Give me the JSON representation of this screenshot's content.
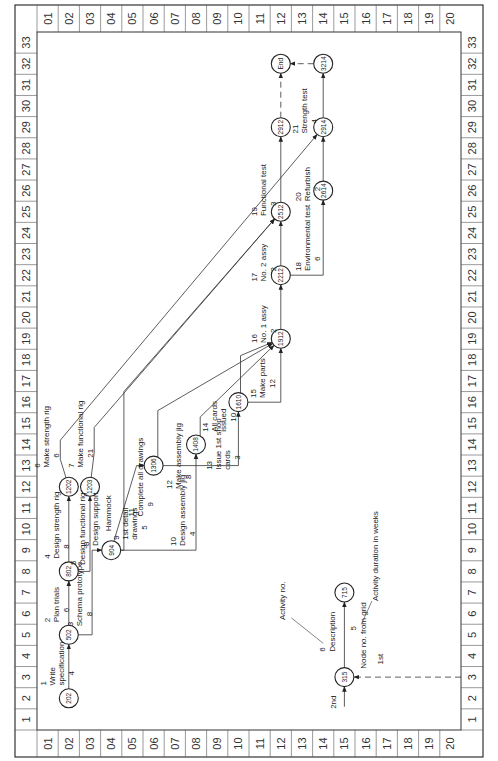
{
  "grid": {
    "columns": [
      "1",
      "2",
      "3",
      "4",
      "5",
      "6",
      "7",
      "8",
      "9",
      "10",
      "11",
      "12",
      "13",
      "14",
      "15",
      "16",
      "17",
      "18",
      "19",
      "20",
      "21",
      "22",
      "23",
      "24",
      "25",
      "26",
      "27",
      "28",
      "29",
      "30",
      "31",
      "32",
      "33"
    ],
    "rows": [
      "01",
      "02",
      "03",
      "04",
      "05",
      "06",
      "07",
      "08",
      "09",
      "10",
      "11",
      "12",
      "13",
      "14",
      "15",
      "16",
      "17",
      "18",
      "19",
      "20"
    ]
  },
  "nodes": [
    {
      "id": "202",
      "col": 2,
      "row": 2
    },
    {
      "id": "502",
      "col": 5,
      "row": 2
    },
    {
      "id": "802",
      "col": 8,
      "row": 2
    },
    {
      "id": "1202",
      "col": 12,
      "row": 2
    },
    {
      "id": "1203",
      "col": 12,
      "row": 3
    },
    {
      "id": "904",
      "col": 9,
      "row": 4
    },
    {
      "id": "1306",
      "col": 13,
      "row": 6
    },
    {
      "id": "1408",
      "col": 14,
      "row": 8
    },
    {
      "id": "1610",
      "col": 16,
      "row": 10
    },
    {
      "id": "1912",
      "col": 19,
      "row": 12
    },
    {
      "id": "2212",
      "col": 22,
      "row": 12
    },
    {
      "id": "2512",
      "col": 25,
      "row": 12
    },
    {
      "id": "2912",
      "col": 29,
      "row": 12
    },
    {
      "id": "END",
      "col": 32,
      "row": 12
    },
    {
      "id": "2614",
      "col": 26,
      "row": 14
    },
    {
      "id": "2914",
      "col": 29,
      "row": 14
    },
    {
      "id": "3214",
      "col": 32,
      "row": 14
    }
  ],
  "activities": [
    {
      "no": "1",
      "desc": "Write specification",
      "desc_lines": [
        "Write",
        "specification"
      ],
      "duration": "4",
      "from": "202",
      "to": "502"
    },
    {
      "no": "2",
      "desc": "Plan trials",
      "desc_lines": [
        "Plan trials"
      ],
      "duration": "6",
      "from": "502",
      "to": "802"
    },
    {
      "no": "3",
      "desc": "Schema prototype",
      "desc_lines": [
        "Schema prototype"
      ],
      "duration": "8",
      "from": "502",
      "to": "904"
    },
    {
      "no": "4",
      "desc": "Design strength rig",
      "desc_lines": [
        "Design strength rig"
      ],
      "duration": "8",
      "from": "802",
      "to": "1202"
    },
    {
      "no": "5",
      "desc": "Design functional rig",
      "desc_lines": [
        "Design functional rig"
      ],
      "duration": "",
      "from": "802",
      "to": "1203"
    },
    {
      "no": "6",
      "desc": "Make strength rig",
      "desc_lines": [
        "Make strength rig"
      ],
      "duration": "6",
      "from": "1202",
      "to": "2914"
    },
    {
      "no": "7",
      "desc": "Make functional rig",
      "desc_lines": [
        "Make functional rig"
      ],
      "duration": "21",
      "from": "1203",
      "to": "2512"
    },
    {
      "no": "8",
      "desc": "Design support",
      "desc_lines": [
        "Design support"
      ],
      "duration": "",
      "from": "904",
      "to": "2512"
    },
    {
      "no": "9",
      "desc": "1st detail drawings",
      "desc_lines": [
        "1st detail",
        "drawings"
      ],
      "duration": "5",
      "from": "904",
      "to": "1306"
    },
    {
      "no": "10",
      "desc": "Design assembly jig",
      "desc_lines": [
        "Design assembly jig"
      ],
      "duration": "4",
      "from": "904",
      "to": "1408"
    },
    {
      "no": "11",
      "desc": "Complete all drawings",
      "desc_lines": [
        "Complete all drawings"
      ],
      "duration": "9",
      "from": "1306",
      "to": "1912"
    },
    {
      "no": "12",
      "desc": "Make assembly jig",
      "desc_lines": [
        "Make assembly jig"
      ],
      "duration": "8",
      "from": "1408",
      "to": "1912"
    },
    {
      "no": "13",
      "desc": "Issue 1st shop cards",
      "desc_lines": [
        "Issue 1st shop",
        "cards"
      ],
      "duration": "3",
      "from": "1306",
      "to": "1610"
    },
    {
      "no": "14",
      "desc": "All cards issued",
      "desc_lines": [
        "All cards",
        "issued"
      ],
      "duration": "10",
      "from": "1610",
      "to": "1912"
    },
    {
      "no": "15",
      "desc": "Make parts",
      "desc_lines": [
        "Make parts"
      ],
      "duration": "12",
      "from": "1610",
      "to": "1912"
    },
    {
      "no": "16",
      "desc": "No. 1 assy",
      "desc_lines": [
        "No. 1 assy"
      ],
      "duration": "2",
      "from": "1912",
      "to": "2212"
    },
    {
      "no": "17",
      "desc": "No. 2 assy",
      "desc_lines": [
        "No. 2 assy"
      ],
      "duration": "2",
      "from": "2212",
      "to": "2512"
    },
    {
      "no": "18",
      "desc": "Environmental test",
      "desc_lines": [
        "Environmental test"
      ],
      "duration": "6",
      "from": "2212",
      "to": "2614"
    },
    {
      "no": "19",
      "desc": "Functional test",
      "desc_lines": [
        "Functional test"
      ],
      "duration": "3",
      "from": "2512",
      "to": "2912"
    },
    {
      "no": "20",
      "desc": "Refurbish",
      "desc_lines": [
        "Refurbish"
      ],
      "duration": "2",
      "from": "2614",
      "to": "2914"
    },
    {
      "no": "21",
      "desc": "Strength test",
      "desc_lines": [
        "Strength test"
      ],
      "duration": "4",
      "from": "2914",
      "to": "3214"
    }
  ],
  "hammock_label": "Hammock",
  "dummies": [
    {
      "from": "2912",
      "to": "END"
    },
    {
      "from": "3214",
      "to": "END"
    }
  ],
  "legend": {
    "from_node": "315",
    "to_node": "715",
    "activity_no": "6",
    "description": "Description",
    "duration": "5",
    "callout_activity_no": "Activity no.",
    "callout_duration": "Activity duration in weeks",
    "callout_node": "Node no. from grid",
    "first": "1st",
    "second": "2nd"
  }
}
